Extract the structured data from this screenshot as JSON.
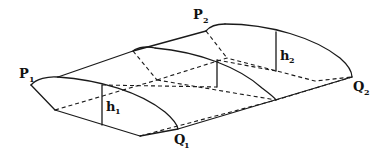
{
  "diagram": {
    "type": "3D wireframe of a curved canopy surface between two ridges",
    "labels": {
      "p1": {
        "main": "P",
        "sub": "1"
      },
      "p2": {
        "main": "P",
        "sub": "2"
      },
      "q1": {
        "main": "Q",
        "sub": "1"
      },
      "q2": {
        "main": "Q",
        "sub": "2"
      },
      "h1": {
        "main": "h",
        "sub": "1"
      },
      "h2": {
        "main": "h",
        "sub": "2"
      }
    },
    "colors": {
      "line": "#1a1a1a",
      "background": "#ffffff"
    }
  }
}
